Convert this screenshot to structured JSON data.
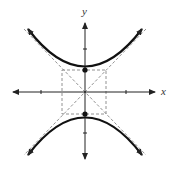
{
  "diagram": {
    "type": "hyperbola",
    "orientation": "vertical",
    "axes": {
      "x_label": "x",
      "y_label": "y"
    },
    "vertices": [
      [
        0,
        1
      ],
      [
        0,
        -1
      ]
    ],
    "fundamental_rectangle": {
      "half_width": 1,
      "half_height": 1
    },
    "asymptotes": [
      "y = x",
      "y = -x"
    ],
    "ticks": {
      "x": [
        -1,
        1
      ],
      "y": [
        -1,
        1
      ]
    }
  }
}
